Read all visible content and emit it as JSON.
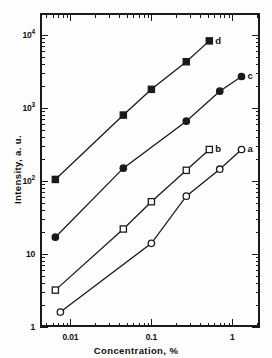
{
  "chart_data": {
    "type": "scatter",
    "title": "",
    "xlabel": "Concentration, %",
    "ylabel": "Intensity, a. u.",
    "xscale": "log",
    "yscale": "log",
    "xlim": [
      0.0042,
      2.2
    ],
    "ylim": [
      1,
      20000
    ],
    "grid": false,
    "legend_position": "inline-right-of-curve",
    "xticks": [
      {
        "value": 0.01,
        "label": "0.01"
      },
      {
        "value": 0.1,
        "label": "0.1"
      },
      {
        "value": 1,
        "label": "1"
      }
    ],
    "yticks": [
      {
        "value": 1,
        "label": "1",
        "exp": ""
      },
      {
        "value": 10,
        "label": "10",
        "exp": ""
      },
      {
        "value": 100,
        "label": "10",
        "exp": "2"
      },
      {
        "value": 1000,
        "label": "10",
        "exp": "3"
      },
      {
        "value": 10000,
        "label": "10",
        "exp": "4"
      }
    ],
    "series": [
      {
        "name": "d",
        "label": "d",
        "marker": "filled-square",
        "color": "#1a1a1a",
        "points": [
          {
            "x": 0.0065,
            "y": 105
          },
          {
            "x": 0.045,
            "y": 800
          },
          {
            "x": 0.1,
            "y": 1800
          },
          {
            "x": 0.27,
            "y": 4300
          },
          {
            "x": 0.52,
            "y": 8300
          }
        ]
      },
      {
        "name": "c",
        "label": "c",
        "marker": "filled-circle",
        "color": "#1a1a1a",
        "points": [
          {
            "x": 0.0065,
            "y": 17
          },
          {
            "x": 0.045,
            "y": 150
          },
          {
            "x": 0.27,
            "y": 660
          },
          {
            "x": 0.7,
            "y": 1700
          },
          {
            "x": 1.3,
            "y": 2700
          }
        ]
      },
      {
        "name": "b",
        "label": "b",
        "marker": "open-square",
        "color": "#1a1a1a",
        "points": [
          {
            "x": 0.0065,
            "y": 3.2
          },
          {
            "x": 0.045,
            "y": 22
          },
          {
            "x": 0.1,
            "y": 52
          },
          {
            "x": 0.27,
            "y": 140
          },
          {
            "x": 0.52,
            "y": 270
          }
        ]
      },
      {
        "name": "a",
        "label": "a",
        "marker": "open-circle",
        "color": "#1a1a1a",
        "points": [
          {
            "x": 0.0075,
            "y": 1.6
          },
          {
            "x": 0.1,
            "y": 14
          },
          {
            "x": 0.27,
            "y": 62
          },
          {
            "x": 0.7,
            "y": 145
          },
          {
            "x": 1.3,
            "y": 270
          }
        ]
      }
    ]
  }
}
